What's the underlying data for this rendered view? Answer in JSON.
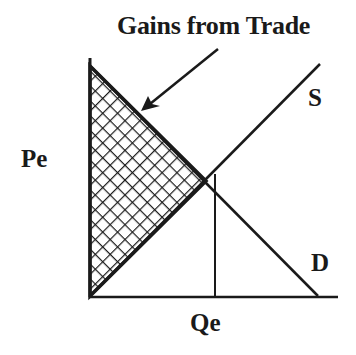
{
  "diagram": {
    "title": "Gains from Trade",
    "type": "supply-demand",
    "labels": {
      "price_equilibrium": "Pe",
      "quantity_equilibrium": "Qe",
      "supply": "S",
      "demand": "D"
    },
    "annotation": {
      "text": "Gains from Trade",
      "points_to": "shaded-triangle"
    },
    "shaded_region": {
      "description": "triangle between demand curve, supply curve and price axis",
      "pattern": "crosshatch"
    },
    "colors": {
      "ink": "#1a1a1a",
      "background": "#ffffff"
    }
  }
}
